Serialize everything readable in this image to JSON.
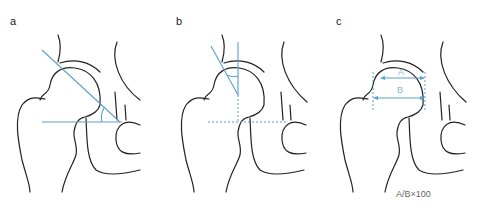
{
  "panels": [
    {
      "label": "a"
    },
    {
      "label": "b"
    },
    {
      "label": "c",
      "measure_labels": [
        "A",
        "B"
      ],
      "formula": "A/B×100"
    }
  ],
  "colors": {
    "bone_outline": "#222222",
    "measurement": "#5b9fcc"
  }
}
